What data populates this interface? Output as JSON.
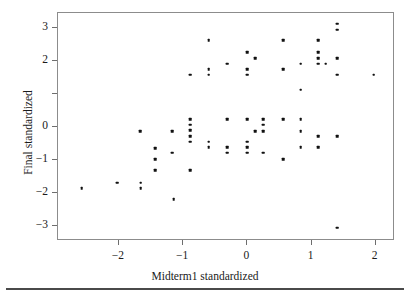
{
  "figure": {
    "background_color": "#ffffff",
    "frame_color": "#8c8c8c",
    "point_color": "#111111",
    "rule_color": "#4a4a4a"
  },
  "axes": {
    "x": {
      "title": "Midterm1 standardized",
      "ticks": [
        -2,
        -1,
        0,
        1,
        2
      ],
      "tick_labels": [
        "−2",
        "−1",
        "0",
        "1",
        "2"
      ],
      "limits": [
        -2.95,
        2.3
      ]
    },
    "y": {
      "title": "Final standardized",
      "ticks": [
        3,
        2,
        1,
        0,
        -1,
        -2,
        -3
      ],
      "tick_labels": [
        "3",
        "2",
        "",
        "0",
        "−1",
        "−2",
        "−3"
      ],
      "limits": [
        -3.45,
        3.45
      ]
    }
  },
  "chart_data": {
    "type": "scatter",
    "title": "",
    "xlabel": "Midterm1 standardized",
    "ylabel": "Final standardized",
    "xlim": [
      -2.95,
      2.3
    ],
    "ylim": [
      -3.45,
      3.45
    ],
    "grid": false,
    "legend": null,
    "marker": "square-dot",
    "n_points": 78,
    "points": [
      [
        -2.58,
        -1.85
      ],
      [
        -2.03,
        -1.68
      ],
      [
        -1.67,
        -0.12
      ],
      [
        -1.66,
        -1.68
      ],
      [
        -1.66,
        -1.85
      ],
      [
        -1.44,
        -0.64
      ],
      [
        -1.44,
        -0.98
      ],
      [
        -1.44,
        -1.31
      ],
      [
        -1.17,
        -0.12
      ],
      [
        -1.17,
        -0.78
      ],
      [
        -1.15,
        -2.18
      ],
      [
        -0.89,
        1.58
      ],
      [
        -0.89,
        0.24
      ],
      [
        -0.89,
        0.07
      ],
      [
        -0.89,
        -0.1
      ],
      [
        -0.89,
        -0.28
      ],
      [
        -0.89,
        -0.45
      ],
      [
        -0.89,
        -1.31
      ],
      [
        -0.6,
        2.62
      ],
      [
        -0.6,
        1.75
      ],
      [
        -0.6,
        1.58
      ],
      [
        -0.6,
        -0.45
      ],
      [
        -0.6,
        -0.62
      ],
      [
        -0.31,
        1.92
      ],
      [
        -0.31,
        0.24
      ],
      [
        -0.31,
        -0.62
      ],
      [
        -0.31,
        -0.78
      ],
      [
        0.0,
        2.27
      ],
      [
        0.0,
        1.75
      ],
      [
        0.0,
        1.58
      ],
      [
        0.0,
        0.24
      ],
      [
        0.0,
        -0.45
      ],
      [
        0.0,
        -0.62
      ],
      [
        0.0,
        -0.78
      ],
      [
        0.12,
        2.09
      ],
      [
        0.12,
        -0.12
      ],
      [
        0.25,
        0.24
      ],
      [
        0.25,
        0.07
      ],
      [
        0.25,
        -0.12
      ],
      [
        0.25,
        -0.78
      ],
      [
        0.56,
        2.62
      ],
      [
        0.56,
        1.75
      ],
      [
        0.56,
        0.24
      ],
      [
        0.56,
        -0.98
      ],
      [
        0.83,
        1.92
      ],
      [
        0.83,
        1.13
      ],
      [
        0.83,
        0.24
      ],
      [
        0.83,
        -0.12
      ],
      [
        0.83,
        -0.62
      ],
      [
        1.1,
        2.62
      ],
      [
        1.1,
        2.27
      ],
      [
        1.1,
        2.09
      ],
      [
        1.1,
        1.92
      ],
      [
        1.1,
        -0.28
      ],
      [
        1.1,
        -0.62
      ],
      [
        1.22,
        1.92
      ],
      [
        1.4,
        3.12
      ],
      [
        1.4,
        2.95
      ],
      [
        1.4,
        2.09
      ],
      [
        1.4,
        1.58
      ],
      [
        1.4,
        -0.28
      ],
      [
        1.4,
        -3.05
      ],
      [
        1.97,
        1.58
      ]
    ]
  }
}
